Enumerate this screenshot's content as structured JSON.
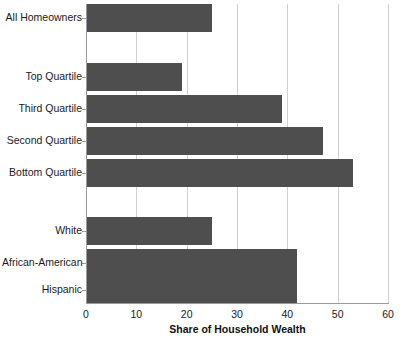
{
  "chart_data": {
    "type": "bar",
    "orientation": "horizontal",
    "title": "",
    "xlabel": "Share of Household Wealth",
    "ylabel": "",
    "xlim": [
      0,
      60
    ],
    "xticks": [
      0,
      10,
      20,
      30,
      40,
      50,
      60
    ],
    "xtick_labels": [
      "0",
      "10",
      "20",
      "30",
      "40",
      "50",
      "60"
    ],
    "grid": true,
    "grid_axis": "x",
    "legend": false,
    "bar_color": "#4e4e4e",
    "categories": [
      "All Homeowners",
      "Top Quartile",
      "Third Quartile",
      "Second Quartile",
      "Bottom Quartile",
      "White",
      "African-American",
      "Hispanic"
    ],
    "values": [
      25,
      19,
      39,
      47,
      53,
      25,
      42,
      42
    ],
    "groups": [
      {
        "name": "overall",
        "categories": [
          "All Homeowners"
        ]
      },
      {
        "name": "income-quartile",
        "categories": [
          "Top Quartile",
          "Third Quartile",
          "Second Quartile",
          "Bottom Quartile"
        ]
      },
      {
        "name": "race-ethnicity",
        "categories": [
          "White",
          "African-American",
          "Hispanic"
        ]
      }
    ]
  },
  "bars": [
    {
      "label": "All Homeowners",
      "value": 25,
      "top": 4,
      "height": 28
    },
    {
      "label": "Top Quartile",
      "value": 19,
      "top": 63,
      "height": 28
    },
    {
      "label": "Third Quartile",
      "value": 39,
      "top": 95,
      "height": 28
    },
    {
      "label": "Second Quartile",
      "value": 47,
      "top": 127,
      "height": 28
    },
    {
      "label": "Bottom Quartile",
      "value": 53,
      "top": 159,
      "height": 28
    },
    {
      "label": "White",
      "value": 25,
      "top": 217,
      "height": 28
    },
    {
      "label": "African-American",
      "value": 42,
      "top": 249,
      "height": 28
    },
    {
      "label": "Hispanic",
      "value": 42,
      "top": 277,
      "height": 26
    }
  ],
  "axis": {
    "x_title": "Share of Household Wealth",
    "ticks": [
      {
        "label": "0",
        "value": 0
      },
      {
        "label": "10",
        "value": 10
      },
      {
        "label": "20",
        "value": 20
      },
      {
        "label": "30",
        "value": 30
      },
      {
        "label": "40",
        "value": 40
      },
      {
        "label": "50",
        "value": 50
      },
      {
        "label": "60",
        "value": 60
      }
    ]
  },
  "colors": {
    "bar": "#4e4e4e",
    "grid": "#d0d0d0",
    "axis": "#9a9a9a",
    "text": "#1a1a1a",
    "background": "#ffffff"
  }
}
